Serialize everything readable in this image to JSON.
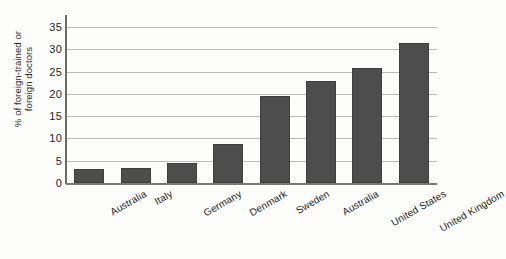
{
  "chart_data": {
    "type": "bar",
    "title": "",
    "subtitle": "",
    "xlabel": "",
    "ylabel": "% of foreign-trained or foreign doctors",
    "ylabel_lines": [
      "% of foreign-trained or",
      "foreign doctors"
    ],
    "categories": [
      "Australia",
      "Italy",
      "Germany",
      "Denmark",
      "Sweden",
      "Australia",
      "United States",
      "United Kingdom"
    ],
    "values": [
      3.1,
      3.4,
      4.5,
      8.8,
      19.6,
      22.8,
      25.8,
      31.4
    ],
    "ylim": [
      0,
      35
    ],
    "ytick_labels": [
      "0",
      "5",
      "10",
      "15",
      "20",
      "25",
      "30",
      "35"
    ],
    "ytick_values": [
      0,
      5,
      10,
      15,
      20,
      25,
      30,
      35
    ],
    "grid": true,
    "grid_axis": "y",
    "legend": false,
    "legend_position": "none",
    "bar_color": "#4d4d4d",
    "grid_color": "#b9b9b9",
    "axis_color": "#6b6b6b",
    "background_color": "#fdfdfb"
  }
}
